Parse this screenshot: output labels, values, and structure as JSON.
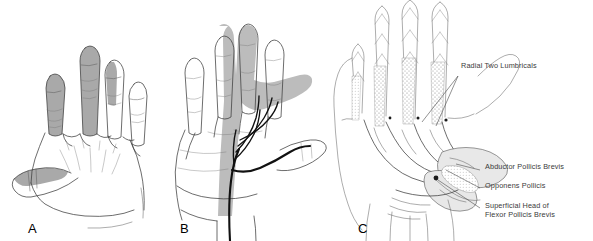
{
  "figure": {
    "background_color": "#ffffff",
    "panels": [
      {
        "letter": "A",
        "name": "dorsal-sensory-distribution",
        "view": "dorsal hand",
        "shading_color": "#a9a9a9",
        "shaded_regions": [
          "thumb dorsal strip",
          "index fingertip",
          "middle fingertip",
          "radial half of ring fingertip"
        ]
      },
      {
        "letter": "B",
        "name": "palmar-sensory-distribution",
        "view": "palmar hand",
        "shading_color": "#bcbcbc",
        "nerve_color": "#111111",
        "shaded_regions": [
          "thumb",
          "index finger",
          "middle finger",
          "radial half of ring finger",
          "radial palm"
        ]
      },
      {
        "letter": "C",
        "name": "thenar-muscle-dissection",
        "view": "palmar dissection",
        "labels": [
          {
            "id": "radial-two-lumbricals",
            "text": "Radial Two Lumbricals"
          },
          {
            "id": "abductor-pollicis-brevis",
            "text": "Abductor Pollicis Brevis"
          },
          {
            "id": "opponens-pollicis",
            "text": "Opponens Pollicis"
          },
          {
            "id": "superficial-head-flexor-pollicis-brevis",
            "text": "Superficial Head of\nFlexor Pollicis Brevis"
          }
        ]
      }
    ]
  }
}
